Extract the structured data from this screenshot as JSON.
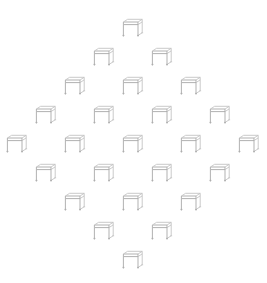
{
  "canvas": {
    "width": 267,
    "height": 283,
    "background": "#ffffff",
    "title": "Chair icon diamond grid"
  },
  "icon": {
    "name": "chair-icon",
    "semantic": "isometric-chair-stool-outline",
    "stroke_color": "#a8a8a8",
    "stroke_color_light": "#c4c4c4",
    "fill": "none",
    "stroke_width": 0.9,
    "size": 24
  },
  "layout": {
    "pattern": "diamond",
    "rows": 9,
    "total_icons": 25,
    "row_counts": [
      1,
      2,
      3,
      4,
      5,
      4,
      3,
      2,
      1
    ],
    "column_spacing": 58,
    "row_spacing": 29,
    "center_x": 133,
    "first_row_y": 16
  },
  "icons": [
    {
      "id": "chair-r1-c1",
      "row": 1,
      "col": 1,
      "x": 121,
      "y": 16
    },
    {
      "id": "chair-r2-c1",
      "row": 2,
      "col": 1,
      "x": 92,
      "y": 45
    },
    {
      "id": "chair-r2-c2",
      "row": 2,
      "col": 2,
      "x": 150,
      "y": 45
    },
    {
      "id": "chair-r3-c1",
      "row": 3,
      "col": 1,
      "x": 63,
      "y": 74
    },
    {
      "id": "chair-r3-c2",
      "row": 3,
      "col": 2,
      "x": 121,
      "y": 74
    },
    {
      "id": "chair-r3-c3",
      "row": 3,
      "col": 3,
      "x": 179,
      "y": 74
    },
    {
      "id": "chair-r4-c1",
      "row": 4,
      "col": 1,
      "x": 34,
      "y": 103
    },
    {
      "id": "chair-r4-c2",
      "row": 4,
      "col": 2,
      "x": 92,
      "y": 103
    },
    {
      "id": "chair-r4-c3",
      "row": 4,
      "col": 3,
      "x": 150,
      "y": 103
    },
    {
      "id": "chair-r4-c4",
      "row": 4,
      "col": 4,
      "x": 208,
      "y": 103
    },
    {
      "id": "chair-r5-c1",
      "row": 5,
      "col": 1,
      "x": 5,
      "y": 132
    },
    {
      "id": "chair-r5-c2",
      "row": 5,
      "col": 2,
      "x": 63,
      "y": 132
    },
    {
      "id": "chair-r5-c3",
      "row": 5,
      "col": 3,
      "x": 121,
      "y": 132
    },
    {
      "id": "chair-r5-c4",
      "row": 5,
      "col": 4,
      "x": 179,
      "y": 132
    },
    {
      "id": "chair-r5-c5",
      "row": 5,
      "col": 5,
      "x": 237,
      "y": 132
    },
    {
      "id": "chair-r6-c1",
      "row": 6,
      "col": 1,
      "x": 34,
      "y": 161
    },
    {
      "id": "chair-r6-c2",
      "row": 6,
      "col": 2,
      "x": 92,
      "y": 161
    },
    {
      "id": "chair-r6-c3",
      "row": 6,
      "col": 3,
      "x": 150,
      "y": 161
    },
    {
      "id": "chair-r6-c4",
      "row": 6,
      "col": 4,
      "x": 208,
      "y": 161
    },
    {
      "id": "chair-r7-c1",
      "row": 7,
      "col": 1,
      "x": 63,
      "y": 190
    },
    {
      "id": "chair-r7-c2",
      "row": 7,
      "col": 2,
      "x": 121,
      "y": 190
    },
    {
      "id": "chair-r7-c3",
      "row": 7,
      "col": 3,
      "x": 179,
      "y": 190
    },
    {
      "id": "chair-r8-c1",
      "row": 8,
      "col": 1,
      "x": 92,
      "y": 219
    },
    {
      "id": "chair-r8-c2",
      "row": 8,
      "col": 2,
      "x": 150,
      "y": 219
    },
    {
      "id": "chair-r9-c1",
      "row": 9,
      "col": 1,
      "x": 121,
      "y": 248
    }
  ]
}
